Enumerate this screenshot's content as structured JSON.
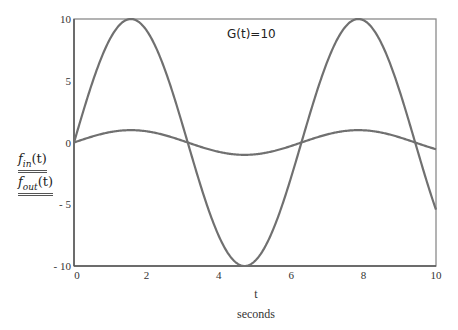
{
  "chart_data": {
    "type": "line",
    "title": "",
    "xlabel": "t",
    "xlabel_units": "seconds",
    "ylabel": [
      "f_in(t)",
      "f_out(t)"
    ],
    "xlim": [
      0,
      10
    ],
    "ylim": [
      -10,
      10
    ],
    "x_ticks": [
      0,
      2,
      4,
      6,
      8,
      10
    ],
    "y_ticks": [
      -10,
      -5,
      0,
      5,
      10
    ],
    "x_tick_labels": [
      "0",
      "2",
      "4",
      "6",
      "8",
      "10"
    ],
    "y_tick_labels": [
      "- 10",
      "- 5",
      "0",
      "5",
      "10"
    ],
    "grid": false,
    "annotation": "G(t)=10",
    "series": [
      {
        "name": "f_in(t)",
        "expression": "sin(t)",
        "amplitude": 1,
        "color": "#707070",
        "x": [
          0,
          1,
          1.571,
          2,
          3,
          3.142,
          4,
          4.712,
          5,
          6,
          6.283,
          7,
          7.854,
          8,
          9,
          9.425,
          10
        ],
        "values": [
          0,
          0.84,
          1,
          0.91,
          0.14,
          0,
          -0.76,
          -1,
          -0.96,
          -0.28,
          0,
          0.66,
          1,
          0.99,
          0.41,
          0,
          -0.54
        ]
      },
      {
        "name": "f_out(t)",
        "expression": "10*sin(t)",
        "amplitude": 10,
        "color": "#707070",
        "x": [
          0,
          1,
          1.571,
          2,
          3,
          3.142,
          4,
          4.712,
          5,
          6,
          6.283,
          7,
          7.854,
          8,
          9,
          9.425,
          10
        ],
        "values": [
          0,
          8.4,
          10,
          9.1,
          1.4,
          0,
          -7.6,
          -10,
          -9.6,
          -2.8,
          0,
          6.6,
          10,
          9.9,
          4.1,
          0,
          -5.4
        ]
      }
    ]
  },
  "legend": {
    "fin_label": "f",
    "fin_sub": "in",
    "fin_arg": "(t)",
    "fout_label": "f",
    "fout_sub": "out",
    "fout_arg": "(t)"
  },
  "annotation": {
    "text": "G(t)=10"
  },
  "axes": {
    "x_label": "t",
    "x_units": "seconds",
    "x_ticks": [
      "0",
      "2",
      "4",
      "6",
      "8",
      "10"
    ],
    "y_ticks": [
      "10",
      "5",
      "0",
      "- 5",
      "- 10"
    ]
  },
  "colors": {
    "curve": "#707070",
    "axis": "#6a6a6a"
  }
}
